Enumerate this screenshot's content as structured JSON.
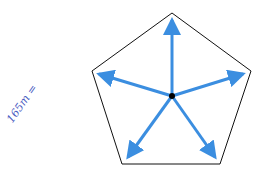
{
  "diagram": {
    "shape": "regular pentagon",
    "annotation": "165m =",
    "center": [
      172,
      96
    ],
    "vertices": [
      [
        172,
        13
      ],
      [
        251,
        71
      ],
      [
        220,
        164
      ],
      [
        122,
        164
      ],
      [
        92,
        71
      ]
    ],
    "arrow_color": "#3b8ee0",
    "outline_color": "#111111",
    "label_color": "#4a5bbf"
  }
}
